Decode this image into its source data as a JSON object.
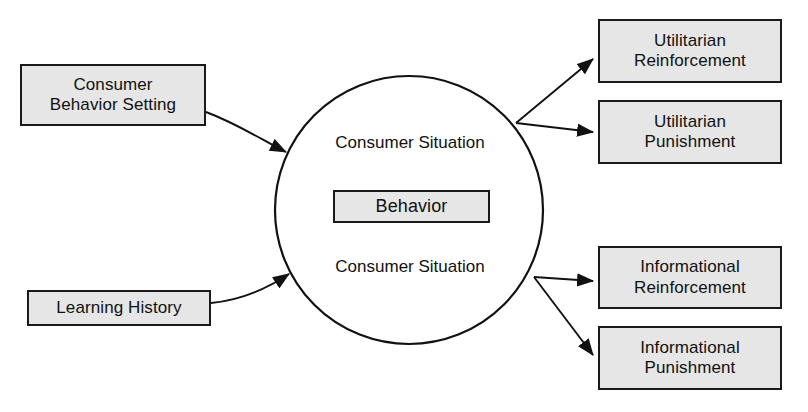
{
  "diagram": {
    "background_color": "#ffffff",
    "box_fill_color": "#e6e6e6",
    "stroke_color": "#1a1a1a",
    "nodes": {
      "consumer_behavior_setting": {
        "line1": "Consumer",
        "line2": "Behavior Setting"
      },
      "learning_history": {
        "line1": "Learning History"
      },
      "behavior": {
        "line1": "Behavior"
      },
      "consumer_situation_top": {
        "line1": "Consumer Situation"
      },
      "consumer_situation_bottom": {
        "line1": "Consumer Situation"
      },
      "utilitarian_reinforcement": {
        "line1": "Utilitarian",
        "line2": "Reinforcement"
      },
      "utilitarian_punishment": {
        "line1": "Utilitarian",
        "line2": "Punishment"
      },
      "informational_reinforcement": {
        "line1": "Informational",
        "line2": "Reinforcement"
      },
      "informational_punishment": {
        "line1": "Informational",
        "line2": "Punishment"
      }
    },
    "edges": [
      {
        "from": "consumer_behavior_setting",
        "to": "consumer_situation_top",
        "style": "curved-arrow"
      },
      {
        "from": "learning_history",
        "to": "consumer_situation_bottom",
        "style": "curved-arrow"
      },
      {
        "from": "consumer_situation_top",
        "to": "utilitarian_reinforcement",
        "style": "straight-arrow"
      },
      {
        "from": "consumer_situation_top",
        "to": "utilitarian_punishment",
        "style": "straight-arrow"
      },
      {
        "from": "consumer_situation_bottom",
        "to": "informational_reinforcement",
        "style": "straight-arrow"
      },
      {
        "from": "consumer_situation_bottom",
        "to": "informational_punishment",
        "style": "straight-arrow"
      }
    ]
  }
}
